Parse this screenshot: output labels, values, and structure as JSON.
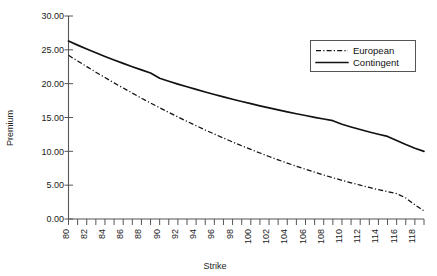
{
  "chart_data": {
    "type": "line",
    "title": "",
    "xlabel": "Strike",
    "ylabel": "Premium",
    "xlim": [
      80,
      119
    ],
    "ylim": [
      0,
      30
    ],
    "ytick_step": 5,
    "ytick_labels": [
      "0.00",
      "5.00",
      "10.00",
      "15.00",
      "20.00",
      "25.00",
      "30.00"
    ],
    "ytick_values": [
      0,
      5,
      10,
      15,
      20,
      25,
      30
    ],
    "xtick_labels": [
      "80",
      "82",
      "84",
      "86",
      "88",
      "90",
      "92",
      "94",
      "96",
      "98",
      "100",
      "102",
      "104",
      "106",
      "108",
      "110",
      "112",
      "114",
      "116",
      "118"
    ],
    "xtick_values": [
      80,
      82,
      84,
      86,
      88,
      90,
      92,
      94,
      96,
      98,
      100,
      102,
      104,
      106,
      108,
      110,
      112,
      114,
      116,
      118
    ],
    "minor_xticks_every": 1,
    "grid": false,
    "legend_position": "upper-right",
    "x": [
      80,
      81,
      82,
      83,
      84,
      85,
      86,
      87,
      88,
      89,
      90,
      91,
      92,
      93,
      94,
      95,
      96,
      97,
      98,
      99,
      100,
      101,
      102,
      103,
      104,
      105,
      106,
      107,
      108,
      109,
      110,
      111,
      112,
      113,
      114,
      115,
      116,
      117,
      118,
      119
    ],
    "series": [
      {
        "name": "European",
        "style": "dash-dot",
        "color": "#111111",
        "values": [
          24.2,
          23.35,
          22.52,
          21.7,
          20.9,
          20.12,
          19.35,
          18.6,
          17.86,
          17.14,
          16.44,
          15.75,
          15.08,
          14.42,
          13.78,
          13.16,
          12.55,
          11.96,
          11.38,
          10.82,
          10.28,
          9.75,
          9.24,
          8.74,
          8.26,
          7.8,
          7.35,
          6.92,
          6.5,
          6.1,
          5.72,
          5.35,
          5.0,
          4.66,
          4.34,
          4.04,
          3.75,
          3.1,
          2.1,
          1.2
        ]
      },
      {
        "name": "Contingent",
        "style": "solid",
        "color": "#111111",
        "values": [
          26.3,
          25.7,
          25.12,
          24.56,
          24.02,
          23.5,
          23.0,
          22.51,
          22.04,
          21.58,
          20.8,
          20.36,
          19.94,
          19.54,
          19.15,
          18.77,
          18.4,
          18.04,
          17.7,
          17.36,
          17.04,
          16.72,
          16.42,
          16.12,
          15.84,
          15.56,
          15.29,
          15.03,
          14.78,
          14.53,
          14.0,
          13.6,
          13.22,
          12.86,
          12.52,
          12.2,
          11.6,
          11.0,
          10.45,
          10.0
        ]
      }
    ]
  },
  "legend": {
    "entries": [
      {
        "label": "European"
      },
      {
        "label": "Contingent"
      }
    ]
  },
  "axes": {
    "x_title": "Strike",
    "y_title": "Premium"
  }
}
